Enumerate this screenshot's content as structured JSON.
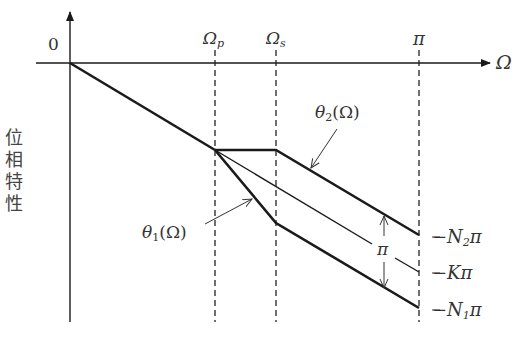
{
  "diagram": {
    "axes": {
      "origin_label": "0",
      "x_label": "Ω",
      "y_label_chars": [
        "位",
        "相",
        "特",
        "性"
      ]
    },
    "x_ticks": {
      "omega_p": {
        "main": "Ω",
        "sub": "p"
      },
      "omega_s": {
        "main": "Ω",
        "sub": "s"
      },
      "pi": "π"
    },
    "curves": {
      "theta2": {
        "main": "θ",
        "sub": "2",
        "arg": "(Ω)"
      },
      "theta1": {
        "main": "θ",
        "sub": "1",
        "arg": "(Ω)"
      }
    },
    "right_labels": {
      "n2": {
        "prefix": "−N",
        "sub": "2",
        "suffix": "π"
      },
      "k": "−Kπ",
      "n1": {
        "prefix": "−N",
        "sub": "1",
        "suffix": "π"
      }
    },
    "gap_label": "π",
    "colors": {
      "line": "#1a1a1a",
      "text": "#333333"
    }
  }
}
